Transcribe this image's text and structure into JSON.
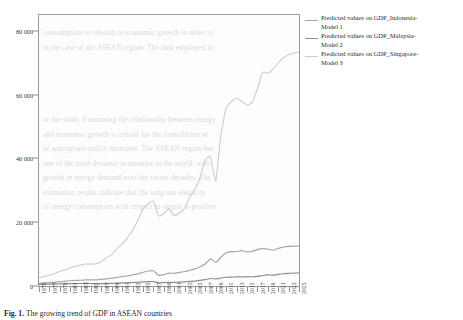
{
  "chart_data": {
    "type": "line",
    "title": "",
    "xlabel": "",
    "ylabel": "",
    "xlim": [
      1975,
      2025
    ],
    "ylim": [
      0,
      85000
    ],
    "grid": false,
    "legend_position": "right",
    "y_ticks": [
      "0",
      "20 000",
      "40 000",
      "60 000",
      "80 000"
    ],
    "y_tick_values": [
      0,
      20000,
      40000,
      60000,
      80000
    ],
    "x": [
      1975,
      1976,
      1977,
      1978,
      1979,
      1980,
      1981,
      1982,
      1983,
      1984,
      1985,
      1986,
      1987,
      1988,
      1989,
      1990,
      1991,
      1992,
      1993,
      1994,
      1995,
      1996,
      1997,
      1998,
      1999,
      2000,
      2001,
      2002,
      2003,
      2004,
      2005,
      2006,
      2007,
      2008,
      2009,
      2010,
      2011,
      2012,
      2013,
      2014,
      2015,
      2016,
      2017,
      2018,
      2019,
      2020,
      2021,
      2022,
      2023,
      2024,
      2025
    ],
    "x_ticks": [
      "1975",
      "1977",
      "1979",
      "1981",
      "1983",
      "1985",
      "1987",
      "1989",
      "1991",
      "1993",
      "1995",
      "1997",
      "1999",
      "2001",
      "2003",
      "2005",
      "2007",
      "2009",
      "2011",
      "2013",
      "2015",
      "2017",
      "2019",
      "2021",
      "2023",
      "2025"
    ],
    "series": [
      {
        "name": "Predicted values on GDP_Singapore-Model 3",
        "label_line1": "Predicted values  on GDP_Singapore-",
        "label_line2": "Model 3",
        "color": "#c9cfc6",
        "values": [
          2500,
          3000,
          3350,
          3950,
          4550,
          5050,
          5700,
          6200,
          6550,
          6900,
          6850,
          6950,
          7700,
          8900,
          9850,
          11800,
          13200,
          15100,
          17500,
          20500,
          24100,
          25800,
          26600,
          22000,
          22700,
          24200,
          22100,
          22900,
          24300,
          28000,
          30400,
          34100,
          39600,
          40400,
          33000,
          47600,
          55900,
          57800,
          58900,
          57900,
          56800,
          57600,
          61900,
          67000,
          66700,
          68000,
          70000,
          71500,
          72500,
          73000,
          73500
        ]
      },
      {
        "name": "Predicted values on GDP_Indonesia-Model 1",
        "label_line1": "Predicted values  on GDP_Indonesia-",
        "label_line2": "Model 1",
        "color": "#a3a9a3",
        "values": [
          850,
          950,
          1050,
          1150,
          1300,
          1500,
          1650,
          1750,
          1800,
          1900,
          1950,
          1900,
          2050,
          2250,
          2450,
          2700,
          2950,
          3200,
          3500,
          3800,
          4300,
          4700,
          4800,
          3350,
          3550,
          4050,
          3950,
          4250,
          4550,
          4950,
          5350,
          6050,
          7000,
          8500,
          7400,
          9100,
          10400,
          10800,
          10750,
          11100,
          10700,
          10900,
          11400,
          11700,
          11600,
          11200,
          11800,
          12200,
          12400,
          12500,
          12600
        ]
      },
      {
        "name": "Predicted values on GDP_Malaysia-Model 2",
        "label_line1": "Predicted values  on GDP_Malaysia-",
        "label_line2": "Model 2",
        "color": "#8e8e8e",
        "values": [
          500,
          530,
          570,
          610,
          660,
          700,
          740,
          770,
          790,
          810,
          790,
          700,
          720,
          770,
          830,
          900,
          960,
          1020,
          1100,
          1180,
          1270,
          1360,
          1400,
          1000,
          1060,
          1160,
          1130,
          1200,
          1280,
          1420,
          1550,
          1750,
          2000,
          2350,
          2200,
          2500,
          2750,
          2800,
          2850,
          2900,
          2850,
          2900,
          3000,
          3300,
          3500,
          3400,
          3650,
          3850,
          3950,
          4050,
          4100
        ]
      }
    ]
  },
  "caption": {
    "label": "Fig. 1.",
    "rest": "The growing trend of GDP in ASEAN countries"
  },
  "background_text": {
    "lines": [
      "consumption in relation to economic growth in order to",
      "in the case of the ASEAN region. The data employed in",
      "",
      "",
      "",
      "",
      "of the study. Examining the relationship between energy",
      "and economic growth is crucial for the formulation of",
      "of appropriate policy measures. The ASEAN region has",
      "one of the most dynamic economies in the world, with",
      "growth in energy demand over the recent decades. The",
      "estimation results indicate that the long run elasticity",
      "of energy consumption with respect to output is positive"
    ]
  }
}
